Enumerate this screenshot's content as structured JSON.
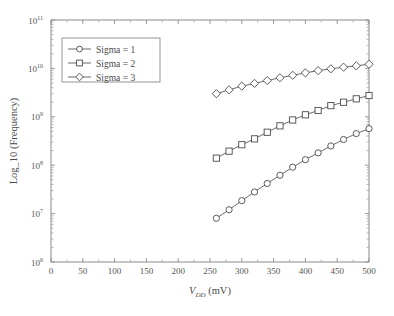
{
  "chart_data": {
    "type": "line",
    "title": "",
    "xlabel": "V_DD (mV)",
    "xlabel_main": "V",
    "xlabel_sub": "DD",
    "xlabel_unit": " (mV)",
    "ylabel": "Log_10 (Frequency)",
    "xlim": [
      0,
      500
    ],
    "ylim": [
      1000000,
      100000000000
    ],
    "yscale": "log",
    "xscale": "linear",
    "grid": false,
    "legend_position": "upper-left",
    "xticks": [
      0,
      50,
      100,
      150,
      200,
      250,
      300,
      350,
      400,
      450,
      500
    ],
    "xtick_labels": [
      "0",
      "50",
      "100",
      "150",
      "200",
      "250",
      "300",
      "350",
      "400",
      "450",
      "500"
    ],
    "yticks": [
      1000000,
      10000000,
      100000000,
      1000000000,
      10000000000,
      100000000000
    ],
    "ytick_labels": [
      "10^6",
      "10^7",
      "10^8",
      "10^9",
      "10^10",
      "10^11"
    ],
    "ytick_exponents": [
      "6",
      "7",
      "8",
      "9",
      "10",
      "11"
    ],
    "ytick_mantissa": "10",
    "x": [
      260,
      280,
      300,
      320,
      340,
      360,
      380,
      400,
      420,
      440,
      460,
      480,
      500
    ],
    "series": [
      {
        "name": "Sigma = 1",
        "marker": "circle",
        "values": [
          8000000.0,
          12000000.0,
          18500000.0,
          28000000.0,
          42000000.0,
          62000000.0,
          91000000.0,
          130000000.0,
          180000000.0,
          250000000.0,
          340000000.0,
          450000000.0,
          570000000.0
        ]
      },
      {
        "name": "Sigma = 2",
        "marker": "square",
        "values": [
          140000000.0,
          195000000.0,
          265000000.0,
          350000000.0,
          480000000.0,
          650000000.0,
          860000000.0,
          1100000000.0,
          1350000000.0,
          1700000000.0,
          2000000000.0,
          2350000000.0,
          2750000000.0
        ]
      },
      {
        "name": "Sigma = 3",
        "marker": "diamond",
        "values": [
          3000000000.0,
          3600000000.0,
          4300000000.0,
          4900000000.0,
          5600000000.0,
          6400000000.0,
          7200000000.0,
          8100000000.0,
          9000000000.0,
          9800000000.0,
          10600000000.0,
          11300000000.0,
          12200000000.0
        ]
      }
    ],
    "colors": {
      "line": "#5a5a5a",
      "axis": "#8a8a8a",
      "text": "#4a4a4a",
      "background": "#ffffff",
      "marker_fill": "#ffffff"
    }
  },
  "legend": {
    "items": [
      {
        "label": "Sigma = 1",
        "marker": "circle"
      },
      {
        "label": "Sigma = 2",
        "marker": "square"
      },
      {
        "label": "Sigma = 3",
        "marker": "diamond"
      }
    ]
  }
}
